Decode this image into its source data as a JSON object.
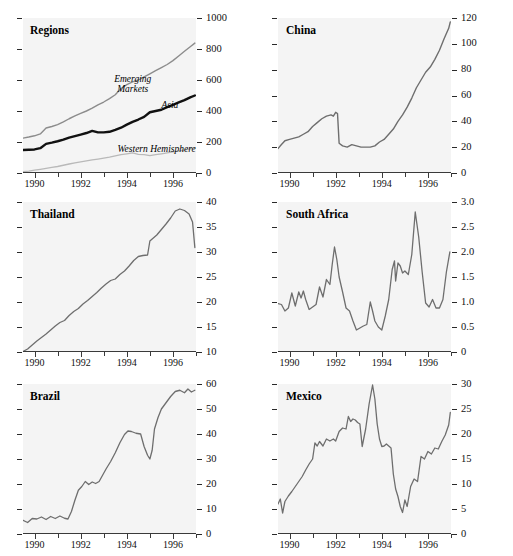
{
  "figure": {
    "background": "#ffffff",
    "plot_background": "#f4f4f4",
    "panel_count": 6,
    "grid": "2 columns x 3 rows"
  },
  "chart_data": [
    {
      "type": "line",
      "title": "Regions",
      "xlabel": "",
      "ylabel": "",
      "xlim": [
        1989.5,
        1997.0
      ],
      "ylim": [
        0,
        1000
      ],
      "yticks": [
        0,
        200,
        400,
        600,
        800,
        1000
      ],
      "ytick_labels": [
        "0",
        "200",
        "400",
        "600",
        "800",
        "1000"
      ],
      "xticks": [
        1990,
        1991,
        1992,
        1993,
        1994,
        1995,
        1996,
        1997
      ],
      "xtick_labels": [
        "1990",
        "1992",
        "1994",
        "1996"
      ],
      "xtick_label_positions": [
        1990,
        1992,
        1994,
        1996
      ],
      "grid": false,
      "legend": "inline annotations",
      "annotations": [
        {
          "text": "Emerging Markets",
          "x": 1993.0,
          "y": 640,
          "style": "italic"
        },
        {
          "text": "Asia",
          "x": 1995.5,
          "y": 470,
          "style": "italic"
        },
        {
          "text": "Western Hemisphere",
          "x": 1993.6,
          "y": 185,
          "style": "italic"
        }
      ],
      "series": [
        {
          "name": "Emerging Markets",
          "color": "#8c8c8c",
          "width": 1.4,
          "x": [
            1989.5,
            1989.75,
            1990.0,
            1990.25,
            1990.5,
            1990.75,
            1991.0,
            1991.25,
            1991.5,
            1991.75,
            1992.0,
            1992.25,
            1992.5,
            1992.75,
            1993.0,
            1993.25,
            1993.5,
            1993.75,
            1994.0,
            1994.25,
            1994.5,
            1994.75,
            1995.0,
            1995.25,
            1995.5,
            1995.75,
            1996.0,
            1996.25,
            1996.5,
            1996.75,
            1996.95
          ],
          "values": [
            225,
            232,
            240,
            252,
            290,
            300,
            312,
            330,
            350,
            368,
            385,
            400,
            418,
            440,
            458,
            480,
            505,
            545,
            570,
            588,
            600,
            620,
            640,
            660,
            680,
            700,
            725,
            755,
            785,
            815,
            838
          ]
        },
        {
          "name": "Asia",
          "color": "#111111",
          "width": 2.4,
          "x": [
            1989.5,
            1989.75,
            1990.0,
            1990.25,
            1990.5,
            1990.75,
            1991.0,
            1991.25,
            1991.5,
            1991.75,
            1992.0,
            1992.25,
            1992.5,
            1992.75,
            1993.0,
            1993.25,
            1993.5,
            1993.75,
            1994.0,
            1994.25,
            1994.5,
            1994.75,
            1995.0,
            1995.25,
            1995.5,
            1995.75,
            1996.0,
            1996.25,
            1996.5,
            1996.75,
            1996.95
          ],
          "values": [
            148,
            150,
            152,
            160,
            188,
            196,
            205,
            215,
            228,
            238,
            248,
            258,
            272,
            262,
            262,
            266,
            278,
            292,
            312,
            330,
            345,
            362,
            392,
            400,
            408,
            425,
            440,
            455,
            470,
            488,
            500
          ]
        },
        {
          "name": "Western Hemisphere",
          "color": "#b9b9b9",
          "width": 1.3,
          "x": [
            1989.5,
            1989.75,
            1990.0,
            1990.25,
            1990.5,
            1990.75,
            1991.0,
            1991.25,
            1991.5,
            1991.75,
            1992.0,
            1992.25,
            1992.5,
            1992.75,
            1993.0,
            1993.25,
            1993.5,
            1993.75,
            1994.0,
            1994.25,
            1994.5,
            1994.75,
            1995.0,
            1995.25,
            1995.5,
            1995.75,
            1996.0,
            1996.25,
            1996.5,
            1996.75,
            1996.95
          ],
          "values": [
            8,
            12,
            18,
            24,
            30,
            36,
            42,
            50,
            58,
            66,
            72,
            78,
            84,
            90,
            96,
            102,
            110,
            118,
            124,
            130,
            120,
            118,
            112,
            118,
            124,
            130,
            136,
            142,
            148,
            156,
            162
          ]
        }
      ]
    },
    {
      "type": "line",
      "title": "China",
      "xlabel": "",
      "ylabel": "",
      "xlim": [
        1989.5,
        1997.0
      ],
      "ylim": [
        0,
        120
      ],
      "yticks": [
        0,
        20,
        40,
        60,
        80,
        100,
        120
      ],
      "ytick_labels": [
        "0",
        "20",
        "40",
        "60",
        "80",
        "100",
        "120"
      ],
      "xticks": [
        1990,
        1991,
        1992,
        1993,
        1994,
        1995,
        1996,
        1997
      ],
      "xtick_labels": [
        "1990",
        "1992",
        "1994",
        "1996"
      ],
      "xtick_label_positions": [
        1990,
        1992,
        1994,
        1996
      ],
      "grid": false,
      "series": [
        {
          "name": "China",
          "color": "#6e6e6e",
          "width": 1.4,
          "x": [
            1989.5,
            1989.65,
            1989.8,
            1990.0,
            1990.2,
            1990.4,
            1990.6,
            1990.8,
            1991.0,
            1991.2,
            1991.4,
            1991.6,
            1991.8,
            1991.9,
            1992.0,
            1992.08,
            1992.15,
            1992.3,
            1992.5,
            1992.7,
            1992.9,
            1993.1,
            1993.3,
            1993.5,
            1993.7,
            1993.9,
            1994.1,
            1994.3,
            1994.5,
            1994.7,
            1994.9,
            1995.1,
            1995.3,
            1995.5,
            1995.7,
            1995.9,
            1996.1,
            1996.3,
            1996.5,
            1996.7,
            1996.9,
            1996.97
          ],
          "values": [
            19,
            22,
            25,
            26,
            27,
            28,
            30,
            32,
            36,
            39,
            42,
            44,
            45,
            44,
            47,
            46,
            23,
            21,
            20,
            22,
            21,
            20,
            20,
            20,
            21,
            24,
            26,
            30,
            34,
            40,
            45,
            51,
            58,
            66,
            72,
            78,
            82,
            88,
            95,
            104,
            112,
            117
          ]
        }
      ]
    },
    {
      "type": "line",
      "title": "Thailand",
      "xlabel": "",
      "ylabel": "",
      "xlim": [
        1989.5,
        1997.0
      ],
      "ylim": [
        10,
        40
      ],
      "yticks": [
        10,
        15,
        20,
        25,
        30,
        35,
        40
      ],
      "ytick_labels": [
        "10",
        "15",
        "20",
        "25",
        "30",
        "35",
        "40"
      ],
      "xticks": [
        1990,
        1991,
        1992,
        1993,
        1994,
        1995,
        1996,
        1997
      ],
      "xtick_labels": [
        "1990",
        "1992",
        "1994",
        "1996"
      ],
      "xtick_label_positions": [
        1990,
        1992,
        1994,
        1996
      ],
      "grid": false,
      "series": [
        {
          "name": "Thailand",
          "color": "#6e6e6e",
          "width": 1.3,
          "x": [
            1989.5,
            1989.7,
            1989.9,
            1990.1,
            1990.3,
            1990.5,
            1990.7,
            1990.9,
            1991.1,
            1991.3,
            1991.5,
            1991.7,
            1991.9,
            1992.1,
            1992.3,
            1992.5,
            1992.7,
            1992.9,
            1993.1,
            1993.3,
            1993.5,
            1993.7,
            1993.9,
            1994.1,
            1994.3,
            1994.5,
            1994.7,
            1994.9,
            1995.0,
            1995.1,
            1995.3,
            1995.5,
            1995.7,
            1995.9,
            1996.1,
            1996.3,
            1996.5,
            1996.7,
            1996.85,
            1996.95
          ],
          "values": [
            10.1,
            10.6,
            11.4,
            12.2,
            12.9,
            13.6,
            14.4,
            15.2,
            15.9,
            16.3,
            17.3,
            18.1,
            18.7,
            19.6,
            20.3,
            21.1,
            21.9,
            22.8,
            23.6,
            24.3,
            24.6,
            25.5,
            26.2,
            27.2,
            28.3,
            29.1,
            29.3,
            29.4,
            32.2,
            32.6,
            33.4,
            34.5,
            35.6,
            36.8,
            38.2,
            38.6,
            38.3,
            37.6,
            36.0,
            30.9
          ]
        }
      ]
    },
    {
      "type": "line",
      "title": "South Africa",
      "xlabel": "",
      "ylabel": "",
      "xlim": [
        1989.5,
        1997.0
      ],
      "ylim": [
        0,
        3.0
      ],
      "yticks": [
        0,
        0.5,
        1.0,
        1.5,
        2.0,
        2.5,
        3.0
      ],
      "ytick_labels": [
        "0",
        "0.5",
        "1.0",
        "1.5",
        "2.0",
        "2.5",
        "3.0"
      ],
      "xticks": [
        1990,
        1991,
        1992,
        1993,
        1994,
        1995,
        1996,
        1997
      ],
      "xtick_labels": [
        "1990",
        "1992",
        "1994",
        "1996"
      ],
      "xtick_label_positions": [
        1990,
        1992,
        1994,
        1996
      ],
      "grid": false,
      "series": [
        {
          "name": "South Africa",
          "color": "#6e6e6e",
          "width": 1.3,
          "x": [
            1989.5,
            1989.65,
            1989.8,
            1989.95,
            1990.1,
            1990.25,
            1990.4,
            1990.5,
            1990.6,
            1990.7,
            1990.85,
            1991.0,
            1991.15,
            1991.3,
            1991.45,
            1991.6,
            1991.75,
            1991.85,
            1991.95,
            1992.05,
            1992.15,
            1992.3,
            1992.45,
            1992.6,
            1992.75,
            1992.9,
            1993.05,
            1993.2,
            1993.35,
            1993.5,
            1993.6,
            1993.7,
            1993.85,
            1994.0,
            1994.15,
            1994.3,
            1994.45,
            1994.55,
            1994.6,
            1994.7,
            1994.8,
            1994.9,
            1995.0,
            1995.15,
            1995.3,
            1995.45,
            1995.6,
            1995.75,
            1995.9,
            1996.05,
            1996.2,
            1996.35,
            1996.5,
            1996.65,
            1996.8,
            1996.95
          ],
          "values": [
            0.97,
            0.95,
            0.82,
            0.88,
            1.18,
            0.92,
            1.2,
            1.08,
            1.22,
            1.05,
            0.85,
            0.9,
            0.95,
            1.3,
            1.1,
            1.45,
            1.35,
            1.75,
            2.1,
            1.85,
            1.5,
            1.2,
            0.88,
            0.82,
            0.62,
            0.44,
            0.48,
            0.52,
            0.55,
            1.0,
            0.82,
            0.62,
            0.5,
            0.44,
            0.72,
            1.05,
            1.65,
            1.82,
            1.42,
            1.78,
            1.72,
            1.58,
            1.62,
            1.55,
            1.95,
            2.8,
            2.3,
            1.6,
            0.98,
            0.9,
            1.05,
            0.88,
            0.88,
            1.05,
            1.6,
            2.0
          ]
        }
      ]
    },
    {
      "type": "line",
      "title": "Brazil",
      "xlabel": "",
      "ylabel": "",
      "xlim": [
        1989.5,
        1997.0
      ],
      "ylim": [
        0,
        60
      ],
      "yticks": [
        0,
        10,
        20,
        30,
        40,
        50,
        60
      ],
      "ytick_labels": [
        "0",
        "10",
        "20",
        "30",
        "40",
        "50",
        "60"
      ],
      "xticks": [
        1990,
        1991,
        1992,
        1993,
        1994,
        1995,
        1996,
        1997
      ],
      "xtick_labels": [
        "1990",
        "1992",
        "1994",
        "1996"
      ],
      "xtick_label_positions": [
        1990,
        1992,
        1994,
        1996
      ],
      "grid": false,
      "series": [
        {
          "name": "Brazil",
          "color": "#6e6e6e",
          "width": 1.3,
          "x": [
            1989.5,
            1989.7,
            1989.9,
            1990.1,
            1990.3,
            1990.5,
            1990.7,
            1990.9,
            1991.1,
            1991.3,
            1991.45,
            1991.6,
            1991.75,
            1991.9,
            1992.05,
            1992.2,
            1992.35,
            1992.5,
            1992.65,
            1992.8,
            1992.95,
            1993.1,
            1993.3,
            1993.5,
            1993.7,
            1993.9,
            1994.05,
            1994.2,
            1994.4,
            1994.6,
            1994.75,
            1994.9,
            1995.0,
            1995.1,
            1995.2,
            1995.35,
            1995.5,
            1995.7,
            1995.9,
            1996.1,
            1996.3,
            1996.5,
            1996.65,
            1996.8,
            1996.95
          ],
          "values": [
            5.5,
            4.6,
            6.2,
            6.0,
            6.8,
            5.8,
            7.0,
            6.2,
            7.2,
            6.3,
            6.0,
            9.0,
            13.5,
            17.5,
            19.0,
            21.0,
            19.8,
            20.8,
            20.2,
            21.0,
            23.5,
            26.0,
            29.0,
            32.5,
            36.5,
            39.8,
            41.2,
            41.0,
            40.3,
            40.0,
            35.0,
            31.5,
            30.0,
            33.5,
            42.0,
            46.5,
            50.0,
            52.5,
            55.0,
            57.0,
            57.5,
            56.5,
            58.0,
            56.8,
            57.5
          ]
        }
      ]
    },
    {
      "type": "line",
      "title": "Mexico",
      "xlabel": "",
      "ylabel": "",
      "xlim": [
        1989.5,
        1997.0
      ],
      "ylim": [
        0,
        30
      ],
      "yticks": [
        0,
        5,
        10,
        15,
        20,
        25,
        30
      ],
      "ytick_labels": [
        "0",
        "5",
        "10",
        "15",
        "20",
        "25",
        "30"
      ],
      "xticks": [
        1990,
        1991,
        1992,
        1993,
        1994,
        1995,
        1996,
        1997
      ],
      "xtick_labels": [
        "1990",
        "1992",
        "1994",
        "1996"
      ],
      "xtick_label_positions": [
        1990,
        1992,
        1994,
        1996
      ],
      "grid": false,
      "series": [
        {
          "name": "Mexico",
          "color": "#6e6e6e",
          "width": 1.3,
          "x": [
            1989.5,
            1989.6,
            1989.7,
            1989.8,
            1989.95,
            1990.1,
            1990.25,
            1990.4,
            1990.55,
            1990.7,
            1990.85,
            1991.0,
            1991.1,
            1991.2,
            1991.3,
            1991.45,
            1991.6,
            1991.75,
            1991.9,
            1992.0,
            1992.15,
            1992.3,
            1992.45,
            1992.55,
            1992.65,
            1992.75,
            1992.85,
            1992.95,
            1993.05,
            1993.15,
            1993.3,
            1993.45,
            1993.6,
            1993.7,
            1993.8,
            1993.9,
            1994.0,
            1994.1,
            1994.2,
            1994.3,
            1994.4,
            1994.5,
            1994.6,
            1994.7,
            1994.8,
            1994.9,
            1995.0,
            1995.1,
            1995.25,
            1995.4,
            1995.55,
            1995.7,
            1995.85,
            1996.0,
            1996.15,
            1996.3,
            1996.45,
            1996.6,
            1996.75,
            1996.9,
            1996.97
          ],
          "values": [
            6.0,
            7.0,
            4.2,
            6.5,
            7.6,
            8.5,
            9.5,
            10.5,
            11.5,
            12.8,
            14.0,
            15.0,
            18.2,
            17.6,
            18.5,
            17.6,
            19.0,
            18.6,
            19.0,
            18.6,
            20.5,
            21.2,
            21.0,
            23.5,
            22.5,
            23.0,
            22.8,
            22.3,
            22.0,
            17.5,
            21.0,
            26.0,
            29.8,
            27.0,
            22.0,
            19.0,
            17.5,
            17.6,
            18.0,
            17.6,
            17.2,
            12.0,
            9.0,
            7.5,
            5.5,
            4.3,
            6.8,
            5.5,
            9.5,
            11.0,
            10.5,
            15.5,
            15.0,
            16.5,
            16.0,
            17.2,
            17.0,
            18.5,
            19.8,
            21.8,
            24.3
          ]
        }
      ]
    }
  ]
}
